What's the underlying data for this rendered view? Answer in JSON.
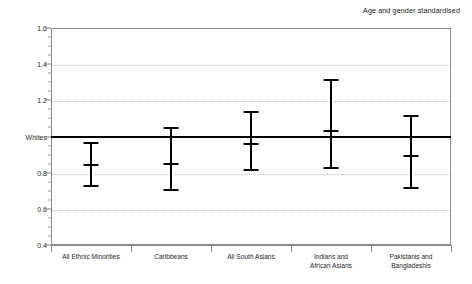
{
  "chart_data": {
    "type": "scatter",
    "title": "Age and gender standardised",
    "subtitle": "",
    "xlabel": "",
    "ylabel": "",
    "ylim": [
      0.4,
      1.6
    ],
    "grid": true,
    "legend": null,
    "reference_line": {
      "label": "Whites",
      "value": 1.0
    },
    "ytick_labels": [
      "1.6",
      "1.4",
      "1.2",
      "Whites",
      "0.8",
      "0.6",
      "0.4"
    ],
    "ytick_values": [
      1.6,
      1.4,
      1.2,
      1.0,
      0.8,
      0.6,
      0.4
    ],
    "categories": [
      "All Ethnic Minorities",
      "Caribbeans",
      "All South Asians",
      "Indians and\nAfrican Asians",
      "Pakistanis and\nBangladeshis"
    ],
    "series": [
      {
        "name": "Relative risk",
        "values": [
          0.84,
          0.85,
          0.96,
          1.03,
          0.89
        ],
        "ci_lower": [
          0.72,
          0.7,
          0.81,
          0.82,
          0.71
        ],
        "ci_upper": [
          0.97,
          1.05,
          1.14,
          1.32,
          1.12
        ]
      }
    ]
  }
}
